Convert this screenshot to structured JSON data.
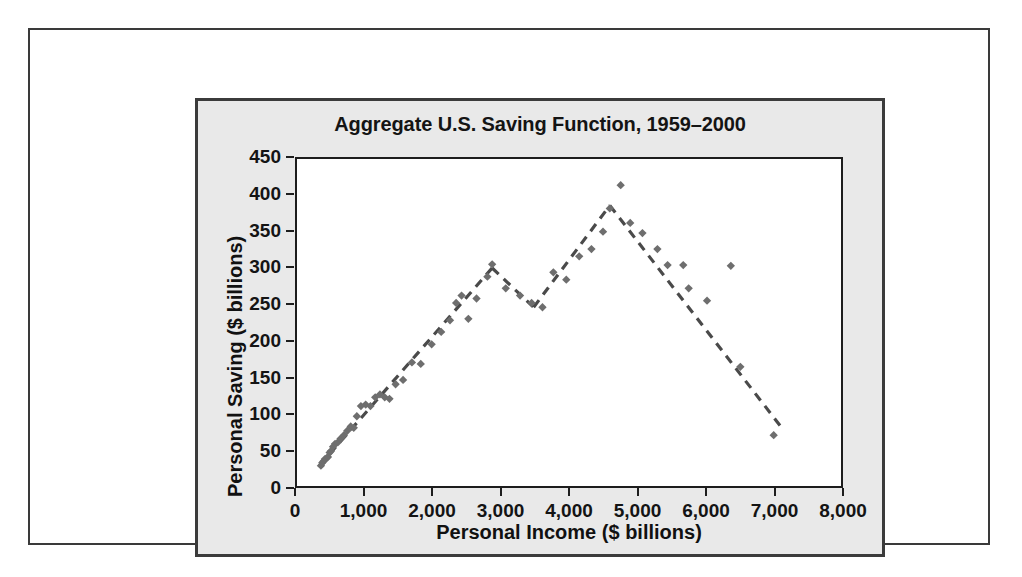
{
  "chart_data": {
    "type": "scatter",
    "title": "Aggregate U.S. Saving Function, 1959–2000",
    "xlabel": "Personal Income ($ billions)",
    "ylabel": "Personal Saving ($ billions)",
    "xlim": [
      0,
      8000
    ],
    "ylim": [
      0,
      450
    ],
    "xticks": [
      0,
      1000,
      2000,
      3000,
      4000,
      5000,
      6000,
      7000,
      8000
    ],
    "xtick_labels": [
      "0",
      "1,000",
      "2,000",
      "3,000",
      "4,000",
      "5,000",
      "6,000",
      "7,000",
      "8,000"
    ],
    "yticks": [
      0,
      50,
      100,
      150,
      200,
      250,
      300,
      350,
      400,
      450
    ],
    "ytick_labels": [
      "0",
      "50",
      "100",
      "150",
      "200",
      "250",
      "300",
      "350",
      "400",
      "450"
    ],
    "grid": false,
    "legend": null,
    "marker": "diamond",
    "marker_color": "#6e6e6e",
    "trendline": {
      "style": "dashed",
      "color": "#4a4a4a",
      "vertices": [
        [
          330,
          28
        ],
        [
          2870,
          300
        ],
        [
          3480,
          246
        ],
        [
          4600,
          386
        ],
        [
          7130,
          80
        ]
      ]
    },
    "series": [
      {
        "name": "Personal saving vs. personal income",
        "points": [
          [
            352,
            28
          ],
          [
            372,
            32
          ],
          [
            390,
            34
          ],
          [
            410,
            37
          ],
          [
            432,
            38
          ],
          [
            455,
            40
          ],
          [
            480,
            46
          ],
          [
            500,
            48
          ],
          [
            530,
            54
          ],
          [
            560,
            58
          ],
          [
            600,
            60
          ],
          [
            640,
            65
          ],
          [
            690,
            70
          ],
          [
            740,
            76
          ],
          [
            790,
            82
          ],
          [
            835,
            80
          ],
          [
            880,
            96
          ],
          [
            940,
            110
          ],
          [
            1010,
            112
          ],
          [
            1080,
            110
          ],
          [
            1150,
            122
          ],
          [
            1220,
            126
          ],
          [
            1290,
            122
          ],
          [
            1360,
            120
          ],
          [
            1450,
            140
          ],
          [
            1560,
            146
          ],
          [
            1690,
            170
          ],
          [
            1820,
            168
          ],
          [
            1980,
            195
          ],
          [
            2120,
            212
          ],
          [
            2250,
            228
          ],
          [
            2340,
            252
          ],
          [
            2420,
            262
          ],
          [
            2520,
            230
          ],
          [
            2640,
            258
          ],
          [
            2800,
            288
          ],
          [
            2870,
            305
          ],
          [
            3070,
            272
          ],
          [
            3280,
            262
          ],
          [
            3450,
            252
          ],
          [
            3610,
            246
          ],
          [
            3770,
            294
          ],
          [
            3960,
            284
          ],
          [
            4150,
            316
          ],
          [
            4330,
            326
          ],
          [
            4500,
            350
          ],
          [
            4600,
            382
          ],
          [
            4760,
            414
          ],
          [
            4900,
            362
          ],
          [
            5080,
            348
          ],
          [
            5300,
            326
          ],
          [
            5450,
            304
          ],
          [
            5680,
            304
          ],
          [
            5760,
            272
          ],
          [
            6030,
            255
          ],
          [
            6380,
            303
          ],
          [
            6520,
            164
          ],
          [
            7010,
            70
          ]
        ]
      }
    ]
  },
  "figure": {
    "panel_background": "#e9e9e9",
    "plot_background": "#ffffff",
    "border_color": "#3b3b3b"
  }
}
